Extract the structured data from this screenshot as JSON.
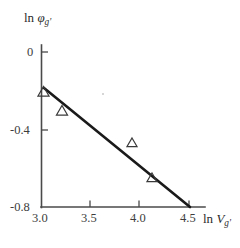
{
  "chart_data": {
    "type": "scatter",
    "title": "",
    "subtitle": "",
    "xlabel": "ln V",
    "xlabel_sub": "g'",
    "ylabel": "ln φ",
    "ylabel_sub": "g'",
    "xlim": [
      3.0,
      4.55
    ],
    "ylim": [
      -0.8,
      0.05
    ],
    "grid": false,
    "legend": "none",
    "xticks": [
      "3.0",
      "3.5",
      "4.0",
      "4.5"
    ],
    "xtick_values": [
      3.0,
      3.5,
      4.0,
      4.5
    ],
    "yticks": [
      "0",
      "-0.4",
      "-0.8"
    ],
    "ytick_values": [
      0,
      -0.4,
      -0.8
    ],
    "marker": "open-triangle",
    "marker_color": "#3a3a3a",
    "line_color": "#1a1a1a",
    "axis_color": "#4a4a4a",
    "series": [
      {
        "name": "measured",
        "type": "scatter",
        "x": [
          3.01,
          3.21,
          3.93,
          4.13
        ],
        "y": [
          -0.205,
          -0.305,
          -0.475,
          -0.655
        ]
      },
      {
        "name": "linear fit",
        "type": "line",
        "x": [
          3.03,
          4.52
        ],
        "y": [
          -0.185,
          -0.8
        ]
      }
    ],
    "annotations": []
  },
  "figure": {
    "background": "#ffffff",
    "width": 240,
    "height": 248
  }
}
